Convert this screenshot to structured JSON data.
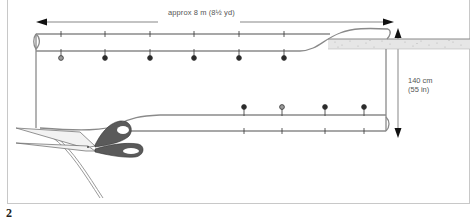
{
  "diagram": {
    "width_label": "approx 8 m (8½ yd)",
    "height_label_line1": "140 cm",
    "height_label_line2": "(55 in)",
    "step_number": "2",
    "colors": {
      "fabric_edge": "#8a8a8a",
      "pin_dark": "#2a2a2a",
      "pin_light": "#9a9a9a",
      "arrow": "#111111",
      "bolt_fill": "#e6e6e6",
      "scissors_handle": "#5a5a5a"
    },
    "top_pins": [
      "light",
      "dark",
      "dark",
      "dark",
      "dark",
      "dark"
    ],
    "bottom_pins": [
      "dark",
      "light",
      "dark",
      "dark"
    ]
  }
}
